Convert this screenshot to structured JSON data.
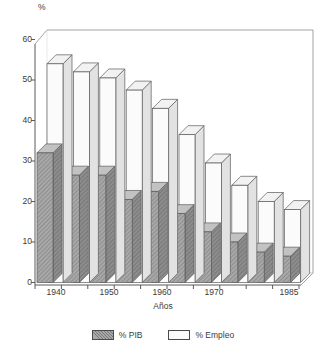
{
  "chart_data": {
    "type": "bar",
    "title": "",
    "subtitle": "",
    "xlabel": "Años",
    "ylabel": "%",
    "ylim": [
      0,
      60
    ],
    "yticks": [
      0,
      10,
      20,
      30,
      40,
      50,
      60
    ],
    "grid": false,
    "legend_position": "bottom",
    "style": "3d-clustered-columns",
    "categories": [
      "1940",
      "1945",
      "1950",
      "1955",
      "1960",
      "1965",
      "1970",
      "1975",
      "1980",
      "1985"
    ],
    "tick_labels": [
      "1940",
      "",
      "1950",
      "",
      "1960",
      "",
      "1970",
      "",
      "",
      "1985"
    ],
    "series": [
      {
        "name": "% PIB",
        "color": "#a8a8a8",
        "values": [
          32,
          26.5,
          26.5,
          20.5,
          22.5,
          17,
          12.5,
          10,
          7.5,
          6.5
        ]
      },
      {
        "name": "% Empleo",
        "color": "#fbfbfb",
        "values": [
          54,
          52,
          50.5,
          47.5,
          43,
          36.5,
          29.5,
          24,
          20,
          18
        ]
      }
    ]
  },
  "axis": {
    "unit_label": "%",
    "x_title": "Años",
    "y_tick_labels": [
      "60",
      "50",
      "40",
      "30",
      "20",
      "10",
      "0"
    ],
    "x_tick_labels": [
      "1940",
      "1950",
      "1960",
      "1970",
      "1985"
    ]
  },
  "legend": {
    "items": [
      {
        "label": "% PIB",
        "swatch": "hatched-gray"
      },
      {
        "label": "% Empleo",
        "swatch": "white"
      }
    ]
  },
  "colors": {
    "bar_pib_face": "#a8a8a8",
    "bar_pib_side": "#8d8d8d",
    "bar_pib_top": "#c2c2c2",
    "bar_empleo_face": "#fbfbfb",
    "bar_empleo_side": "#e2e2e2",
    "bar_empleo_top": "#f2f2f2",
    "outline": "#555555",
    "axis": "#5a5a5a",
    "text": "#3a3a3a",
    "background": "#ffffff"
  }
}
